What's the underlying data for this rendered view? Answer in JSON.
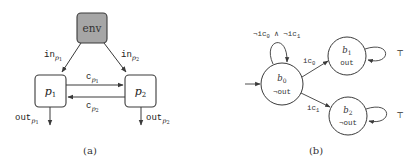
{
  "figure_a": {
    "caption": "(a)",
    "env_node": {
      "label": "env",
      "fill": "#a6a6a6"
    },
    "process_nodes": [
      {
        "id": "p1",
        "base": "p",
        "sub": "1"
      },
      {
        "id": "p2",
        "base": "p",
        "sub": "2"
      }
    ],
    "edges": {
      "in_p1": {
        "base": "in",
        "sub_base": "p",
        "sub_idx": "1"
      },
      "in_p2": {
        "base": "in",
        "sub_base": "p",
        "sub_idx": "2"
      },
      "c_p1": {
        "base": "c",
        "sub_base": "p",
        "sub_idx": "1"
      },
      "c_p2": {
        "base": "c",
        "sub_base": "p",
        "sub_idx": "2"
      },
      "out_p1": {
        "base": "out",
        "sub_base": "p",
        "sub_idx": "1"
      },
      "out_p2": {
        "base": "out",
        "sub_base": "p",
        "sub_idx": "2"
      }
    }
  },
  "figure_b": {
    "caption": "(b)",
    "states": [
      {
        "id": "b0",
        "base": "b",
        "sub": "0",
        "output": "¬out",
        "initial": true
      },
      {
        "id": "b1",
        "base": "b",
        "sub": "1",
        "output": "out"
      },
      {
        "id": "b2",
        "base": "b",
        "sub": "2",
        "output": "¬out"
      }
    ],
    "transitions": {
      "b0_self": {
        "label_neg1": "¬ic",
        "sub1": "0",
        "and": " ∧ ",
        "label_neg2": "¬ic",
        "sub2": "1"
      },
      "b0_b1": {
        "base": "ic",
        "sub": "0"
      },
      "b0_b2": {
        "base": "ic",
        "sub": "1"
      },
      "b1_self": {
        "label": "⊤"
      },
      "b2_self": {
        "label": "⊤"
      }
    }
  },
  "colors": {
    "stroke": "#3a3a3a",
    "text": "#222222",
    "env_fill": "#a6a6a6",
    "node_fill": "#ffffff"
  }
}
